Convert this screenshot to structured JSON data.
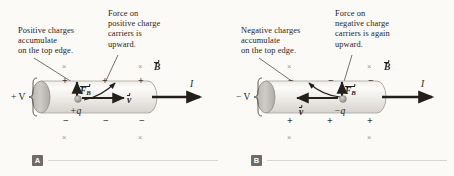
{
  "figure": {
    "background_color": "#fbfaf7",
    "ink_color": "#231f1d",
    "field_mark_color": "#9c9894",
    "badge_color": "#6f6b68"
  },
  "panels": [
    {
      "id": "A",
      "badge_label": "A",
      "carrier_sign": "positive",
      "captions": {
        "accumulation": "Positive charges\naccumulate\non the top edge.",
        "force": "Force on\npositive charge\ncarriers is\nupward."
      },
      "labels": {
        "potential": "+ V",
        "magnetic_field": "B",
        "magnetic_force": "F",
        "magnetic_force_subscript": "B",
        "velocity": "v",
        "current": "I",
        "charge": "+q"
      },
      "top_edge_signs": [
        "+",
        "+",
        "+"
      ],
      "bottom_edge_signs": [
        "−",
        "−",
        "−"
      ],
      "field_marks": [
        "×",
        "×",
        "×",
        "×",
        "×",
        "×"
      ],
      "velocity_direction": "right",
      "force_direction": "up",
      "current_direction": "right"
    },
    {
      "id": "B",
      "badge_label": "B",
      "carrier_sign": "negative",
      "captions": {
        "accumulation": "Negative charges\naccumulate\non the top edge.",
        "force": "Force on\nnegative charge\ncarriers is again\nupward."
      },
      "labels": {
        "potential": "− V",
        "magnetic_field": "B",
        "magnetic_force": "F",
        "magnetic_force_subscript": "B",
        "velocity": "v",
        "current": "I",
        "charge": "−q"
      },
      "top_edge_signs": [
        "−",
        "−",
        "−"
      ],
      "bottom_edge_signs": [
        "+",
        "+",
        "+"
      ],
      "field_marks": [
        "×",
        "×",
        "×",
        "×",
        "×",
        "×"
      ],
      "velocity_direction": "left",
      "force_direction": "up",
      "current_direction": "right"
    }
  ]
}
